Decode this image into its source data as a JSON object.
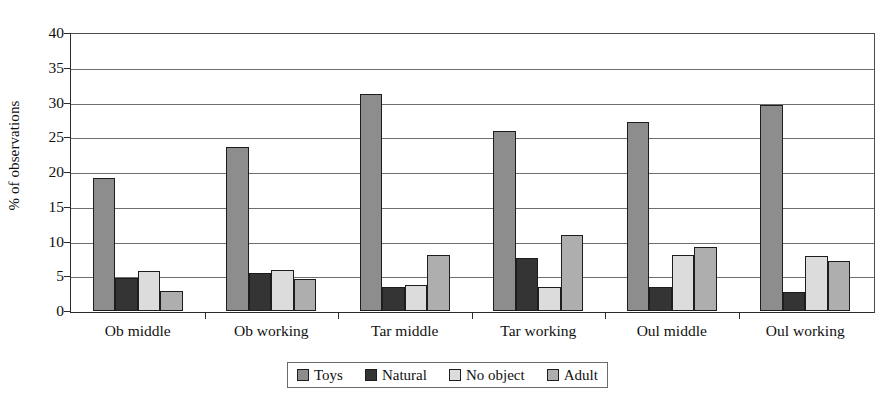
{
  "chart_data": {
    "type": "bar",
    "title": "",
    "subtitle": "",
    "xlabel": "",
    "ylabel": "% of observations",
    "ylim": [
      0,
      40
    ],
    "yticks": [
      0,
      5,
      10,
      15,
      20,
      25,
      30,
      35,
      40
    ],
    "ytick_labels": [
      "0",
      "5",
      "10",
      "15",
      "20",
      "25",
      "30",
      "35",
      "40"
    ],
    "grid": true,
    "legend_position": "bottom-center",
    "categories": [
      "Ob middle",
      "Ob working",
      "Tar middle",
      "Tar working",
      "Oul middle",
      "Oul working"
    ],
    "series": [
      {
        "name": "Toys",
        "color": "#8d8d8d",
        "values": [
          19.1,
          23.6,
          31.2,
          25.9,
          27.2,
          29.7
        ]
      },
      {
        "name": "Natural",
        "color": "#343434",
        "values": [
          4.7,
          5.4,
          3.4,
          7.7,
          3.4,
          2.8
        ]
      },
      {
        "name": "No object",
        "color": "#dcdcdc",
        "values": [
          5.8,
          5.9,
          3.7,
          3.4,
          8.0,
          7.9
        ]
      },
      {
        "name": "Adult",
        "color": "#aeaeae",
        "values": [
          2.9,
          4.6,
          8.0,
          11.0,
          9.2,
          7.2
        ]
      }
    ]
  },
  "axis": {
    "y_title": "% of observations"
  }
}
